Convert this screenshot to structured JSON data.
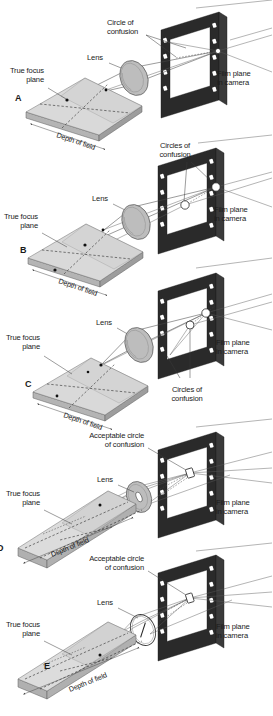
{
  "figure": {
    "background_color": "#ffffff",
    "ink_color": "#1a1a1a",
    "plane_fill": "#d9d9d9",
    "frame_fill": "#2a2a2a",
    "lens_fill": "#bdbdbd"
  },
  "labels": {
    "circle_of_confusion": "Circle of\nconfusion",
    "circles_of_confusion": "Circles of\nconfusion",
    "acceptable_circle_of_confusion": "Acceptable circle\nof confusion",
    "lens": "Lens",
    "true_focus_plane": "True focus\nplane",
    "film_plane": "Film plane\nin camera",
    "depth_of_field": "Depth of field"
  },
  "panels": [
    {
      "id": "A",
      "letter": "A",
      "letter_visible": true,
      "lens_label": "Lens",
      "focus_plane_label": "True focus\nplane",
      "film_plane_label": "Film plane\nin camera",
      "confusion_label": "Circle of\nconfusion",
      "confusion_label_lines": [
        "Circle of",
        "confusion"
      ],
      "focus_plane_label_lines": [
        "True focus",
        "plane"
      ],
      "film_plane_label_lines": [
        "Film plane",
        "in camera"
      ],
      "depth_of_field_label": "Depth of field",
      "confusion_count": 1,
      "aperture": "wide",
      "focus_plane_shape": "square",
      "depth_of_field_extent": "shallow-wide-plane"
    },
    {
      "id": "B",
      "letter": "B",
      "letter_visible": true,
      "lens_label": "Lens",
      "focus_plane_label": "True focus\nplane",
      "film_plane_label": "Film plane\nin camera",
      "confusion_label": "Circles of\nconfusion",
      "confusion_label_lines": [
        "Circles of",
        "confusion"
      ],
      "focus_plane_label_lines": [
        "True focus",
        "plane"
      ],
      "film_plane_label_lines": [
        "Film plane",
        "in camera"
      ],
      "depth_of_field_label": "Depth of field",
      "confusion_count": 2,
      "aperture": "wide",
      "focus_plane_shape": "square",
      "depth_of_field_extent": "shallow-wide-plane"
    },
    {
      "id": "C",
      "letter": "C",
      "letter_visible": true,
      "lens_label": "Lens",
      "focus_plane_label": "True focus\nplane",
      "film_plane_label": "Film plane\nin camera",
      "confusion_label": "Circles of\nconfusion",
      "confusion_label_lines": [
        "Circles of",
        "confusion"
      ],
      "focus_plane_label_lines": [
        "True focus",
        "plane"
      ],
      "film_plane_label_lines": [
        "Film plane",
        "in camera"
      ],
      "depth_of_field_label": "Depth of field",
      "confusion_count": 2,
      "aperture": "wide",
      "focus_plane_shape": "square",
      "depth_of_field_extent": "shallow-wide-plane"
    },
    {
      "id": "D",
      "letter": "D",
      "letter_visible": true,
      "letter_clipped": true,
      "lens_label": "Lens",
      "focus_plane_label": "True focus\nplane",
      "film_plane_label": "Film plane\nin camera",
      "confusion_label": "Acceptable circle\nof confusion",
      "confusion_label_lines": [
        "Acceptable circle",
        "of confusion"
      ],
      "focus_plane_label_lines": [
        "True focus",
        "plane"
      ],
      "film_plane_label_lines": [
        "Film plane",
        "in camera"
      ],
      "depth_of_field_label": "Depth of field",
      "confusion_count": 1,
      "aperture": "narrow",
      "focus_plane_shape": "long-narrow-slab",
      "depth_of_field_extent": "deep-narrow-slab"
    },
    {
      "id": "E",
      "letter": "E",
      "letter_visible": true,
      "lens_label": "Lens",
      "focus_plane_label": "True focus\nplane",
      "film_plane_label": "Film plane\nin camera",
      "confusion_label": "Acceptable circle\nof confusion",
      "confusion_label_lines": [
        "Acceptable circle",
        "of confusion"
      ],
      "focus_plane_label_lines": [
        "True focus",
        "plane"
      ],
      "film_plane_label_lines": [
        "Film plane",
        "in camera"
      ],
      "depth_of_field_label": "Depth of field",
      "confusion_count": 1,
      "aperture": "pinhole",
      "focus_plane_shape": "long-narrow-slab",
      "depth_of_field_extent": "deep-narrow-slab"
    }
  ]
}
